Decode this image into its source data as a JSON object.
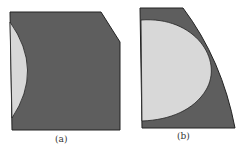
{
  "figures": [
    {
      "label": "(a)",
      "colors": {
        "outer": "#5e5e5e",
        "inner": "#d8d8d8",
        "stroke": "#222222"
      }
    },
    {
      "label": "(b)",
      "colors": {
        "outer": "#5e5e5e",
        "inner": "#d8d8d8",
        "stroke": "#222222"
      }
    }
  ]
}
